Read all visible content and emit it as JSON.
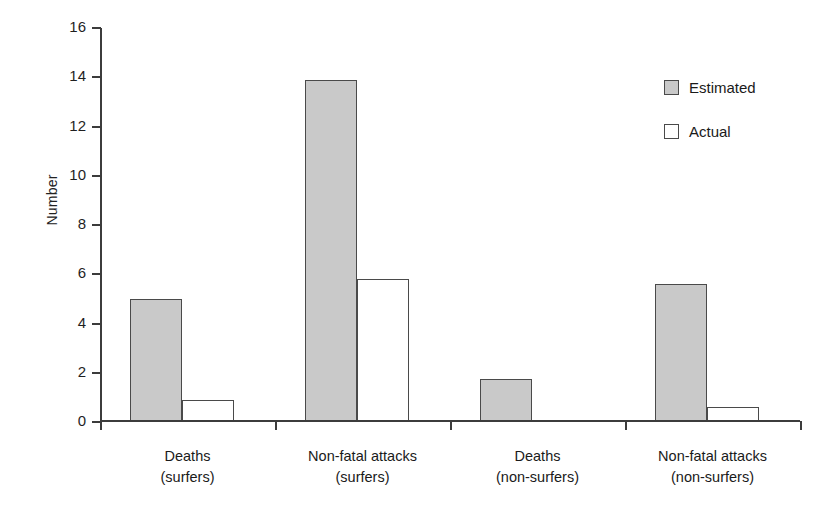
{
  "chart_data": {
    "type": "bar",
    "title": "",
    "subtitle": "",
    "xlabel": "",
    "ylabel": "Number",
    "ylim": [
      0,
      16
    ],
    "ytick_step": 2,
    "yticks": [
      "0",
      "2",
      "4",
      "6",
      "8",
      "10",
      "12",
      "14",
      "16"
    ],
    "grid": false,
    "legend_position": "top-right",
    "categories": [
      "Deaths\n(surfers)",
      "Non-fatal attacks\n(surfers)",
      "Deaths\n(non-surfers)",
      "Non-fatal attacks\n(non-surfers)"
    ],
    "category_lines": [
      [
        "Deaths",
        "(surfers)"
      ],
      [
        "Non-fatal attacks",
        "(surfers)"
      ],
      [
        "Deaths",
        "(non-surfers)"
      ],
      [
        "Non-fatal attacks",
        "(non-surfers)"
      ]
    ],
    "series": [
      {
        "name": "Estimated",
        "color": "#c9c9c9",
        "values": [
          5.0,
          13.9,
          1.75,
          5.6
        ]
      },
      {
        "name": "Actual",
        "color": "#ffffff",
        "values": [
          0.9,
          5.8,
          0.0,
          0.6
        ]
      }
    ]
  },
  "legend": {
    "items": [
      {
        "label": "Estimated",
        "swatch": "estimated"
      },
      {
        "label": "Actual",
        "swatch": "actual"
      }
    ]
  },
  "axis": {
    "y_title": "Number"
  },
  "colors": {
    "estimated_fill": "#c9c9c9",
    "actual_fill": "#ffffff",
    "outline": "#4a4a4a",
    "axis": "#3c3c3c",
    "text": "#1a1a1a"
  }
}
